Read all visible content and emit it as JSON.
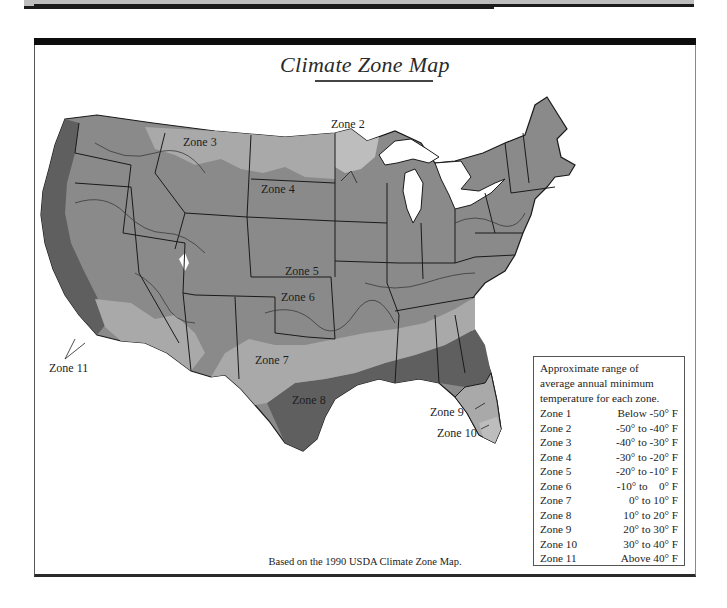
{
  "page": {
    "title": "Climate Zone Map",
    "footnote": "Based on the 1990 USDA Climate Zone Map."
  },
  "colors": {
    "zone_dark": "#5f5f5f",
    "zone_mid": "#8a8a8a",
    "zone_light": "#a9a9a9",
    "zone_lightest": "#bdbdbd",
    "water": "#ffffff",
    "border_lines": "#1a1a1a",
    "frame_bar": "#0d0d0d"
  },
  "map": {
    "labels": [
      {
        "text": "Zone 2",
        "x": 296,
        "y": 83
      },
      {
        "text": "Zone 3",
        "x": 148,
        "y": 101
      },
      {
        "text": "Zone 4",
        "x": 226,
        "y": 148
      },
      {
        "text": "Zone 5",
        "x": 250,
        "y": 230
      },
      {
        "text": "Zone 6",
        "x": 246,
        "y": 256
      },
      {
        "text": "Zone 7",
        "x": 220,
        "y": 319
      },
      {
        "text": "Zone 8",
        "x": 257,
        "y": 359
      },
      {
        "text": "Zone 9",
        "x": 395,
        "y": 371
      },
      {
        "text": "Zone 10",
        "x": 402,
        "y": 392
      },
      {
        "text": "Zone 11",
        "x": 14,
        "y": 327
      }
    ]
  },
  "legend": {
    "header": [
      "Approximate range of",
      "average annual minimum",
      "temperature for each zone."
    ],
    "zones": [
      {
        "zone": "Zone 1",
        "range": "Below -50° F"
      },
      {
        "zone": "Zone 2",
        "range": "-50° to -40° F"
      },
      {
        "zone": "Zone 3",
        "range": "-40° to -30° F"
      },
      {
        "zone": "Zone 4",
        "range": "-30° to -20° F"
      },
      {
        "zone": "Zone 5",
        "range": "-20° to -10° F"
      },
      {
        "zone": "Zone 6",
        "range": "-10° to    0° F"
      },
      {
        "zone": "Zone 7",
        "range": "0° to 10° F"
      },
      {
        "zone": "Zone 8",
        "range": "10° to 20° F"
      },
      {
        "zone": "Zone 9",
        "range": "20° to 30° F"
      },
      {
        "zone": "Zone 10",
        "range": "30° to 40° F"
      },
      {
        "zone": "Zone 11",
        "range": "Above 40° F"
      }
    ]
  }
}
